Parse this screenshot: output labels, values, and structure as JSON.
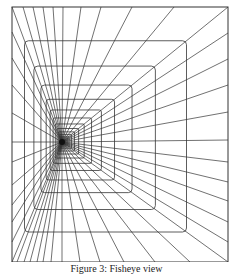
{
  "figure": {
    "caption": "Figure 3: Fisheye view",
    "stroke_color": "#333333",
    "background": "#ffffff",
    "frame": {
      "x1": 12,
      "y1": 7,
      "x2": 228,
      "y2": 262
    },
    "vanishing_point": {
      "x": 62,
      "y": 142
    },
    "nested_rect_scale": 0.75,
    "nested_rect_count": 26,
    "edge_points": {
      "top": [
        23,
        33,
        43,
        53,
        63,
        81,
        101,
        132,
        174
      ],
      "bottom": [
        17,
        24,
        30,
        37,
        43,
        51,
        62,
        80,
        100,
        124,
        155,
        190
      ],
      "left": [
        32,
        58,
        85,
        113,
        142,
        162,
        185,
        205,
        222,
        242
      ],
      "right": [
        33,
        59,
        85,
        112,
        140,
        162,
        182,
        201,
        222,
        242
      ]
    }
  }
}
